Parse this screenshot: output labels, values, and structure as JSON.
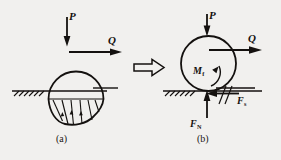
{
  "figure": {
    "background_color": "#f1f0ee",
    "ink_color": "#14110f",
    "panels": [
      {
        "id": "a",
        "caption": "(a)",
        "description": "deformable wheel resting on ground showing distributed contact pressure",
        "labels": {
          "load_P": "P",
          "drive_Q": "Q"
        }
      },
      {
        "id": "b",
        "caption": "(b)",
        "description": "equivalent free body diagram of the wheel with resultant contact reactions",
        "labels": {
          "load_P": "P",
          "drive_Q": "Q",
          "rolling_moment": "M",
          "rolling_moment_sub": "f",
          "friction_force": "F",
          "friction_force_sub": "s",
          "normal_force": "F",
          "normal_force_sub": "N"
        }
      }
    ],
    "transition_arrow": "double-right-arrow"
  }
}
